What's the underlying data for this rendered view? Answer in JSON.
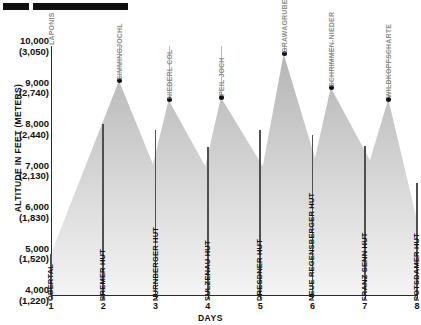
{
  "header": {
    "redacted_bar_1": "",
    "redacted_bar_2": ""
  },
  "axes": {
    "y_title": "ALTITUDE IN FEET (METERS)",
    "x_title": "DAYS",
    "y_ticks": [
      {
        "feet": "10,000",
        "meters": "(3,050)"
      },
      {
        "feet": "9,000",
        "meters": "(2,740)"
      },
      {
        "feet": "8,000",
        "meters": "(2,440)"
      },
      {
        "feet": "7,000",
        "meters": "(2,130)"
      },
      {
        "feet": "6,000",
        "meters": "(1,830)"
      },
      {
        "feet": "5,000",
        "meters": "(1,520)"
      },
      {
        "feet": "4,000",
        "meters": "(1,220)"
      }
    ],
    "x_ticks": [
      "1",
      "2",
      "3",
      "4",
      "5",
      "6",
      "7",
      "8"
    ]
  },
  "chart_data": {
    "type": "area",
    "title": "",
    "xlabel": "DAYS",
    "ylabel": "ALTITUDE IN FEET (METERS)",
    "xlim": [
      1,
      8
    ],
    "ylim": [
      4000,
      10000
    ],
    "y_unit_primary": "feet",
    "y_unit_secondary": "meters",
    "grid": false,
    "legend": "none",
    "passes": [
      {
        "name": "LAPONIS",
        "day": 1.0,
        "altitude_ft": 10000,
        "labeled_dot": false
      },
      {
        "name": "SIMMINGJOCHL",
        "day": 2.3,
        "altitude_ft": 9160,
        "labeled_dot": true
      },
      {
        "name": "NIEDERL COL",
        "day": 3.25,
        "altitude_ft": 8700,
        "labeled_dot": true
      },
      {
        "name": "PEIL JOCH",
        "day": 4.25,
        "altitude_ft": 8760,
        "labeled_dot": true
      },
      {
        "name": "GRAWAGRUBENNIEDER",
        "day": 5.45,
        "altitude_ft": 9810,
        "labeled_dot": true
      },
      {
        "name": "SCHRIMMEN-NIEDER",
        "day": 6.35,
        "altitude_ft": 9000,
        "labeled_dot": true
      },
      {
        "name": "WILDKOPFSCHARTE",
        "day": 7.45,
        "altitude_ft": 8720,
        "labeled_dot": true
      }
    ],
    "huts": [
      {
        "name": "OBERTAL",
        "day": 1,
        "altitude_ft": 5000
      },
      {
        "name": "BREMER HUT",
        "day": 2,
        "altitude_ft": 8130
      },
      {
        "name": "NURNBERGER HUT",
        "day": 3,
        "altitude_ft": 7980
      },
      {
        "name": "SULZENAU HUT",
        "day": 4,
        "altitude_ft": 7560
      },
      {
        "name": "DRESDNER HUT",
        "day": 5,
        "altitude_ft": 7980
      },
      {
        "name": "NEUE REGENSBERGER HUT",
        "day": 6,
        "altitude_ft": 7860
      },
      {
        "name": "FRANZ SENN HUT",
        "day": 7,
        "altitude_ft": 7600
      },
      {
        "name": "POTSDAMER HUT",
        "day": 8,
        "altitude_ft": 6700
      }
    ],
    "profile_points": [
      {
        "day": 1.0,
        "altitude_ft": 5000
      },
      {
        "day": 2.3,
        "altitude_ft": 9160
      },
      {
        "day": 2.95,
        "altitude_ft": 7150
      },
      {
        "day": 3.25,
        "altitude_ft": 8700
      },
      {
        "day": 3.95,
        "altitude_ft": 7100
      },
      {
        "day": 4.25,
        "altitude_ft": 8760
      },
      {
        "day": 5.05,
        "altitude_ft": 7100
      },
      {
        "day": 5.45,
        "altitude_ft": 9810
      },
      {
        "day": 6.05,
        "altitude_ft": 7300
      },
      {
        "day": 6.35,
        "altitude_ft": 9000
      },
      {
        "day": 7.1,
        "altitude_ft": 7250
      },
      {
        "day": 7.45,
        "altitude_ft": 8720
      },
      {
        "day": 8.0,
        "altitude_ft": 5800
      }
    ]
  },
  "colors": {
    "terrain_top": "#b5b5b5",
    "terrain_bottom": "#f2f2f2",
    "dot": "#111111",
    "hut_bar": "#4f4f4f",
    "leader_line": "#b9b9b9",
    "pass_text": "#8d8d8d",
    "hut_text": "#111111",
    "axis": "#2b2b2b",
    "redaction": "#111111"
  }
}
